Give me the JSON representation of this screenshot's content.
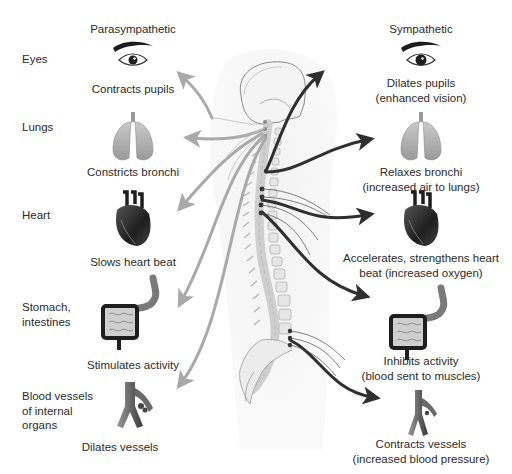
{
  "headers": {
    "parasympathetic": "Parasympathetic",
    "sympathetic": "Sympathetic"
  },
  "organs": [
    {
      "name": "Eyes",
      "lines": [
        "Eyes"
      ],
      "icon": "eye-icon",
      "parasympathetic": [
        "Contracts pupils"
      ],
      "sympathetic": [
        "Dilates pupils",
        "(enhanced vision)"
      ]
    },
    {
      "name": "Lungs",
      "lines": [
        "Lungs"
      ],
      "icon": "lungs-icon",
      "parasympathetic": [
        "Constricts bronchi"
      ],
      "sympathetic": [
        "Relaxes bronchi",
        "(increased air to lungs)"
      ]
    },
    {
      "name": "Heart",
      "lines": [
        "Heart"
      ],
      "icon": "heart-icon",
      "parasympathetic": [
        "Slows heart beat"
      ],
      "sympathetic": [
        "Accelerates, strengthens heart",
        "beat (increased oxygen)"
      ]
    },
    {
      "name": "Stomach, intestines",
      "lines": [
        "Stomach,",
        "intestines"
      ],
      "icon": "digestive-tract-icon",
      "parasympathetic": [
        "Stimulates activity"
      ],
      "sympathetic": [
        "Inhibits activity",
        "(blood sent to muscles)"
      ]
    },
    {
      "name": "Blood vessels of internal organs",
      "lines": [
        "Blood vessels",
        "of internal",
        "organs"
      ],
      "icon": "blood-vessel-icon",
      "parasympathetic": [
        "Dilates vessels"
      ],
      "sympathetic": [
        "Contracts vessels",
        "(increased blood pressure)"
      ]
    }
  ],
  "colors": {
    "parasympathetic_arrow": "#a9a9a9",
    "sympathetic_arrow": "#2f2f2f",
    "spine_bone": "#dcdcdc",
    "ganglion_dot": "#333333",
    "text": "#2a2a2a"
  }
}
